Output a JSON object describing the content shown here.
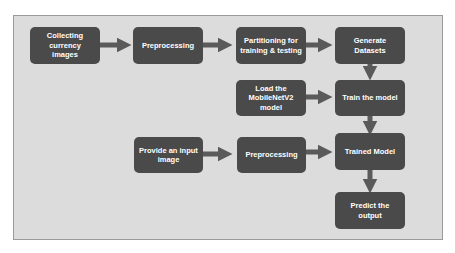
{
  "diagram": {
    "colors": {
      "node_fill": "#4a4a4a",
      "node_text": "#ffffff",
      "arrow": "#5a5a5a",
      "background": "#dcdcdc",
      "border": "#9a9a9a"
    },
    "nodes": [
      {
        "id": "collect",
        "label": "Collecting currency\nimages"
      },
      {
        "id": "preprocess1",
        "label": "Preprocessing"
      },
      {
        "id": "partition",
        "label": "Partitioning for\ntraining & testing"
      },
      {
        "id": "generate",
        "label": "Generate\nDatasets"
      },
      {
        "id": "load",
        "label": "Load the\nMobileNetV2\nmodel"
      },
      {
        "id": "train",
        "label": "Train the model"
      },
      {
        "id": "input",
        "label": "Provide an input\nimage"
      },
      {
        "id": "preprocess2",
        "label": "Preprocessing"
      },
      {
        "id": "trained",
        "label": "Trained Model"
      },
      {
        "id": "predict",
        "label": "Predict the output"
      }
    ],
    "edges": [
      {
        "from": "collect",
        "to": "preprocess1"
      },
      {
        "from": "preprocess1",
        "to": "partition"
      },
      {
        "from": "partition",
        "to": "generate"
      },
      {
        "from": "generate",
        "to": "train"
      },
      {
        "from": "load",
        "to": "train"
      },
      {
        "from": "train",
        "to": "trained"
      },
      {
        "from": "input",
        "to": "preprocess2"
      },
      {
        "from": "preprocess2",
        "to": "trained"
      },
      {
        "from": "trained",
        "to": "predict"
      }
    ]
  }
}
